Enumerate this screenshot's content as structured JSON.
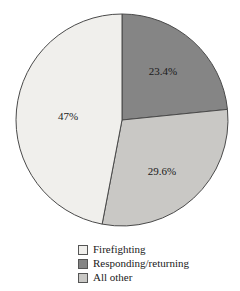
{
  "chart_data": {
    "type": "pie",
    "title": "",
    "subtitle": "",
    "xlabel": "",
    "ylabel": "",
    "grid": false,
    "legend_position": "bottom",
    "start_angle_deg": 0,
    "direction": "clockwise",
    "center": {
      "x": 122,
      "y": 120
    },
    "radius": 106,
    "categories": [
      "Firefighting",
      "Responding/returning",
      "All other"
    ],
    "values": [
      47.0,
      23.4,
      29.6
    ],
    "labels": [
      "47%",
      "23.4%",
      "29.6%"
    ],
    "colors": [
      "#f0efec",
      "#858585",
      "#c9c8c5"
    ],
    "slices": [
      {
        "name": "Responding/returning",
        "value": 23.4,
        "label": "23.4%",
        "color": "#858585",
        "start_deg": 0,
        "end_deg": 84.24,
        "label_x": 163,
        "label_y": 72
      },
      {
        "name": "All other",
        "value": 29.6,
        "label": "29.6%",
        "color": "#c9c8c5",
        "start_deg": 84.24,
        "end_deg": 190.8,
        "label_x": 162,
        "label_y": 172
      },
      {
        "name": "Firefighting",
        "value": 47.0,
        "label": "47%",
        "color": "#f0efec",
        "start_deg": 190.8,
        "end_deg": 360,
        "label_x": 68,
        "label_y": 117
      }
    ]
  },
  "legend": {
    "items": [
      {
        "label": "Firefighting",
        "color": "#f0efec"
      },
      {
        "label": "Responding/returning",
        "color": "#858585"
      },
      {
        "label": "All other",
        "color": "#c9c8c5"
      }
    ]
  },
  "style": {
    "outline_color": "#4a4a4a",
    "text_color": "#1a1a1a",
    "background": "#ffffff"
  }
}
